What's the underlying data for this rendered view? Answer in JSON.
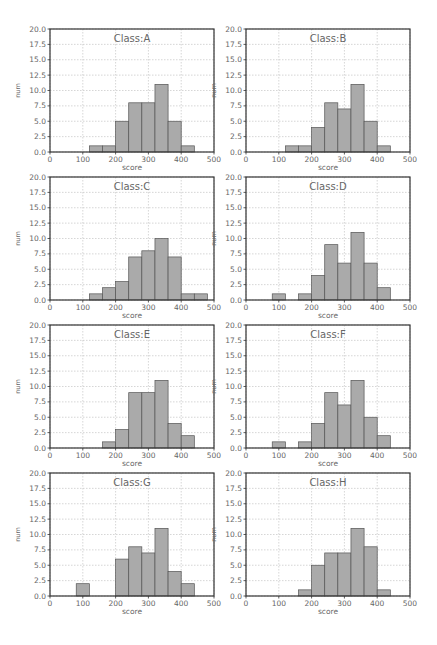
{
  "figure": {
    "xlabel": "score",
    "ylabel": "num",
    "colors": {
      "bar": "#aaaaaa",
      "bar_edge": "#555555",
      "frame": "#333333",
      "grid": "#bbbbbb",
      "text": "#666666"
    }
  },
  "chart_data": [
    {
      "type": "bar",
      "title": "Class:A",
      "bin_width": 40,
      "bin_edges_start": [
        120,
        160,
        200,
        240,
        280,
        320,
        360,
        400
      ],
      "values": [
        1,
        1,
        5,
        8,
        8,
        11,
        5,
        1
      ],
      "xlabel": "score",
      "ylabel": "num",
      "xlim": [
        0,
        500
      ],
      "ylim": [
        0,
        20
      ],
      "xticks": [
        0,
        100,
        200,
        300,
        400,
        500
      ],
      "yticks": [
        "0.0",
        "2.5",
        "5.0",
        "7.5",
        "10.0",
        "12.5",
        "15.0",
        "17.5",
        "20.0"
      ],
      "grid": true
    },
    {
      "type": "bar",
      "title": "Class:B",
      "bin_width": 40,
      "bin_edges_start": [
        120,
        160,
        200,
        240,
        280,
        320,
        360,
        400
      ],
      "values": [
        1,
        1,
        4,
        8,
        7,
        11,
        5,
        1
      ],
      "xlabel": "score",
      "ylabel": "num",
      "xlim": [
        0,
        500
      ],
      "ylim": [
        0,
        20
      ],
      "xticks": [
        0,
        100,
        200,
        300,
        400,
        500
      ],
      "yticks": [
        "0.0",
        "2.5",
        "5.0",
        "7.5",
        "10.0",
        "12.5",
        "15.0",
        "17.5",
        "20.0"
      ],
      "grid": true
    },
    {
      "type": "bar",
      "title": "Class:C",
      "bin_width": 40,
      "bin_edges_start": [
        120,
        160,
        200,
        240,
        280,
        320,
        360,
        400,
        440
      ],
      "values": [
        1,
        2,
        3,
        7,
        8,
        10,
        7,
        1,
        1
      ],
      "xlabel": "score",
      "ylabel": "num",
      "xlim": [
        0,
        500
      ],
      "ylim": [
        0,
        20
      ],
      "xticks": [
        0,
        100,
        200,
        300,
        400,
        500
      ],
      "yticks": [
        "0.0",
        "2.5",
        "5.0",
        "7.5",
        "10.0",
        "12.5",
        "15.0",
        "17.5",
        "20.0"
      ],
      "grid": true
    },
    {
      "type": "bar",
      "title": "Class:D",
      "bin_width": 40,
      "bin_edges_start": [
        80,
        120,
        160,
        200,
        240,
        280,
        320,
        360,
        400
      ],
      "values": [
        1,
        0,
        1,
        4,
        9,
        6,
        11,
        6,
        2
      ],
      "xlabel": "score",
      "ylabel": "num",
      "xlim": [
        0,
        500
      ],
      "ylim": [
        0,
        20
      ],
      "xticks": [
        0,
        100,
        200,
        300,
        400,
        500
      ],
      "yticks": [
        "0.0",
        "2.5",
        "5.0",
        "7.5",
        "10.0",
        "12.5",
        "15.0",
        "17.5",
        "20.0"
      ],
      "grid": true
    },
    {
      "type": "bar",
      "title": "Class:E",
      "bin_width": 40,
      "bin_edges_start": [
        160,
        200,
        240,
        280,
        320,
        360,
        400
      ],
      "values": [
        1,
        3,
        9,
        9,
        11,
        4,
        2
      ],
      "xlabel": "score",
      "ylabel": "num",
      "xlim": [
        0,
        500
      ],
      "ylim": [
        0,
        20
      ],
      "xticks": [
        0,
        100,
        200,
        300,
        400,
        500
      ],
      "yticks": [
        "0.0",
        "2.5",
        "5.0",
        "7.5",
        "10.0",
        "12.5",
        "15.0",
        "17.5",
        "20.0"
      ],
      "grid": true
    },
    {
      "type": "bar",
      "title": "Class:F",
      "bin_width": 40,
      "bin_edges_start": [
        80,
        120,
        160,
        200,
        240,
        280,
        320,
        360,
        400
      ],
      "values": [
        1,
        0,
        1,
        4,
        9,
        7,
        11,
        5,
        2
      ],
      "xlabel": "score",
      "ylabel": "num",
      "xlim": [
        0,
        500
      ],
      "ylim": [
        0,
        20
      ],
      "xticks": [
        0,
        100,
        200,
        300,
        400,
        500
      ],
      "yticks": [
        "0.0",
        "2.5",
        "5.0",
        "7.5",
        "10.0",
        "12.5",
        "15.0",
        "17.5",
        "20.0"
      ],
      "grid": true
    },
    {
      "type": "bar",
      "title": "Class:G",
      "bin_width": 40,
      "bin_edges_start": [
        80,
        120,
        160,
        200,
        240,
        280,
        320,
        360,
        400
      ],
      "values": [
        2,
        0,
        0,
        6,
        8,
        7,
        11,
        4,
        2
      ],
      "xlabel": "score",
      "ylabel": "num",
      "xlim": [
        0,
        500
      ],
      "ylim": [
        0,
        20
      ],
      "xticks": [
        0,
        100,
        200,
        300,
        400,
        500
      ],
      "yticks": [
        "0.0",
        "2.5",
        "5.0",
        "7.5",
        "10.0",
        "12.5",
        "15.0",
        "17.5",
        "20.0"
      ],
      "grid": true
    },
    {
      "type": "bar",
      "title": "Class:H",
      "bin_width": 40,
      "bin_edges_start": [
        160,
        200,
        240,
        280,
        320,
        360,
        400
      ],
      "values": [
        1,
        5,
        7,
        7,
        11,
        8,
        1
      ],
      "xlabel": "score",
      "ylabel": "num",
      "xlim": [
        0,
        500
      ],
      "ylim": [
        0,
        20
      ],
      "xticks": [
        0,
        100,
        200,
        300,
        400,
        500
      ],
      "yticks": [
        "0.0",
        "2.5",
        "5.0",
        "7.5",
        "10.0",
        "12.5",
        "15.0",
        "17.5",
        "20.0"
      ],
      "grid": true
    }
  ]
}
